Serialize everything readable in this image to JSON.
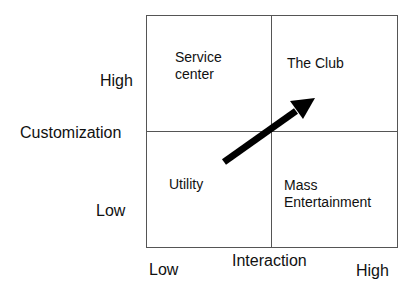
{
  "diagram": {
    "type": "2x2 matrix",
    "y_axis": {
      "title": "Customization",
      "high_label": "High",
      "low_label": "Low"
    },
    "x_axis": {
      "title": "Interaction",
      "low_label": "Low",
      "high_label": "High"
    },
    "quadrants": {
      "top_left": {
        "line1": "Service",
        "line2": "center"
      },
      "top_right": {
        "line1": "The Club"
      },
      "bottom_left": {
        "line1": "Utility"
      },
      "bottom_right": {
        "line1": "Mass",
        "line2": "Entertainment"
      }
    },
    "arrow": {
      "from": "Utility",
      "to": "The Club",
      "color": "#000000"
    },
    "colors": {
      "grid_line": "#555555",
      "text": "#111111",
      "background": "#ffffff"
    }
  }
}
